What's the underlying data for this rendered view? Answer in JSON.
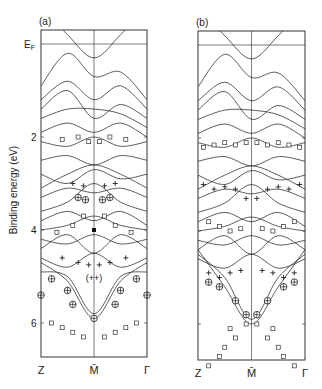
{
  "chart_data": {
    "type": "line",
    "title": "",
    "ylabel": "Binding energy (eV)",
    "xlabel": "",
    "ylim": [
      6.9,
      -0.3
    ],
    "y_ticks": [
      {
        "label": "E_F",
        "value": 0
      },
      {
        "label": "2",
        "value": 2
      },
      {
        "label": "4",
        "value": 4
      },
      {
        "label": "6",
        "value": 6
      }
    ],
    "panels": [
      {
        "id": "a",
        "label": "(a)",
        "x_ticks": [
          "Z",
          "M̄",
          "Γ"
        ],
        "annotation": {
          "text": "(++)",
          "x": 0.5,
          "y": 5.0
        },
        "bands": [
          [
            -0.8,
            -0.2,
            0.3,
            -0.2,
            -0.8
          ],
          [
            0.9,
            0.2,
            0.7,
            0.6,
            1.2
          ],
          [
            1.2,
            0.8,
            1.2,
            0.9,
            1.4
          ],
          [
            1.4,
            1.0,
            1.6,
            1.3,
            1.6
          ],
          [
            1.6,
            1.4,
            1.4,
            1.5,
            1.8
          ],
          [
            1.9,
            1.7,
            1.9,
            1.7,
            2.0
          ],
          [
            2.1,
            2.2,
            2.0,
            2.2,
            2.1
          ],
          [
            2.5,
            2.4,
            2.6,
            2.4,
            2.5
          ],
          [
            2.8,
            3.0,
            2.7,
            2.9,
            2.8
          ],
          [
            3.1,
            2.8,
            2.6,
            2.8,
            3.1
          ],
          [
            3.3,
            3.1,
            3.2,
            3.1,
            3.3
          ],
          [
            3.6,
            3.4,
            3.0,
            3.4,
            3.6
          ],
          [
            3.8,
            3.6,
            3.8,
            3.6,
            3.9
          ],
          [
            4.0,
            3.9,
            3.7,
            3.9,
            4.0
          ],
          [
            4.2,
            4.3,
            4.1,
            4.3,
            4.2
          ],
          [
            4.4,
            4.1,
            4.5,
            4.1,
            4.4
          ],
          [
            4.6,
            4.8,
            4.5,
            4.8,
            4.6
          ],
          [
            4.9,
            5.0,
            5.8,
            5.0,
            4.9
          ],
          [
            4.7,
            5.1,
            5.9,
            5.1,
            4.7
          ]
        ],
        "markers": {
          "squares": [
            [
              0.2,
              2.05
            ],
            [
              0.35,
              2.0
            ],
            [
              0.45,
              2.1
            ],
            [
              0.55,
              2.1
            ],
            [
              0.65,
              2.0
            ],
            [
              0.8,
              2.05
            ],
            [
              0.3,
              3.9
            ],
            [
              0.4,
              3.7
            ],
            [
              0.6,
              3.7
            ],
            [
              0.7,
              3.9
            ],
            [
              0.15,
              4.05
            ],
            [
              0.85,
              4.05
            ],
            [
              0.1,
              6.0
            ],
            [
              0.2,
              6.1
            ],
            [
              0.3,
              6.2
            ],
            [
              0.4,
              6.3
            ],
            [
              0.6,
              6.3
            ],
            [
              0.7,
              6.2
            ],
            [
              0.8,
              6.1
            ],
            [
              0.9,
              6.0
            ]
          ],
          "plus": [
            [
              0.3,
              3.0
            ],
            [
              0.4,
              3.05
            ],
            [
              0.6,
              3.05
            ],
            [
              0.7,
              3.0
            ],
            [
              0.2,
              4.6
            ],
            [
              0.35,
              4.7
            ],
            [
              0.45,
              4.75
            ],
            [
              0.55,
              4.75
            ],
            [
              0.65,
              4.7
            ],
            [
              0.8,
              4.6
            ]
          ],
          "circled_plus": [
            [
              0.35,
              3.3
            ],
            [
              0.42,
              3.35
            ],
            [
              0.58,
              3.35
            ],
            [
              0.65,
              3.3
            ],
            [
              0.1,
              5.05
            ],
            [
              0.9,
              5.05
            ],
            [
              0.25,
              5.3
            ],
            [
              0.75,
              5.3
            ],
            [
              0.0,
              5.4
            ],
            [
              1.0,
              5.4
            ],
            [
              0.3,
              5.6
            ],
            [
              0.7,
              5.6
            ],
            [
              0.5,
              5.9
            ]
          ],
          "filled": [
            [
              0.5,
              4.0
            ]
          ]
        }
      },
      {
        "id": "b",
        "label": "(b)",
        "x_ticks": [
          "Z",
          "M̄",
          "Γ"
        ],
        "bands": [
          [
            -0.8,
            -0.2,
            0.3,
            -0.2,
            -0.8
          ],
          [
            0.9,
            0.2,
            0.7,
            0.6,
            1.2
          ],
          [
            1.2,
            0.8,
            1.2,
            0.9,
            1.4
          ],
          [
            1.4,
            1.0,
            1.6,
            1.3,
            1.6
          ],
          [
            1.6,
            1.4,
            1.4,
            1.5,
            1.8
          ],
          [
            1.9,
            1.7,
            1.9,
            1.7,
            2.0
          ],
          [
            2.1,
            2.2,
            2.0,
            2.2,
            2.1
          ],
          [
            2.5,
            2.4,
            2.6,
            2.4,
            2.5
          ],
          [
            2.8,
            3.0,
            2.7,
            2.9,
            2.8
          ],
          [
            3.1,
            2.8,
            2.6,
            2.8,
            3.1
          ],
          [
            3.3,
            3.1,
            3.2,
            3.1,
            3.3
          ],
          [
            3.6,
            3.4,
            3.0,
            3.4,
            3.6
          ],
          [
            3.8,
            3.6,
            3.8,
            3.6,
            3.9
          ],
          [
            4.0,
            3.9,
            3.7,
            3.9,
            4.0
          ],
          [
            4.2,
            4.3,
            4.1,
            4.3,
            4.2
          ],
          [
            4.4,
            4.1,
            4.5,
            4.1,
            4.4
          ],
          [
            4.6,
            4.8,
            4.5,
            4.8,
            4.6
          ],
          [
            4.5,
            5.0,
            5.9,
            5.0,
            4.5
          ],
          [
            4.4,
            5.2,
            6.0,
            5.2,
            4.4
          ]
        ],
        "markers": {
          "squares": [
            [
              0.05,
              2.2
            ],
            [
              0.15,
              2.15
            ],
            [
              0.25,
              2.1
            ],
            [
              0.35,
              2.15
            ],
            [
              0.45,
              2.1
            ],
            [
              0.55,
              2.1
            ],
            [
              0.65,
              2.15
            ],
            [
              0.75,
              2.1
            ],
            [
              0.85,
              2.15
            ],
            [
              0.95,
              2.2
            ],
            [
              0.1,
              3.8
            ],
            [
              0.2,
              3.9
            ],
            [
              0.3,
              4.0
            ],
            [
              0.4,
              3.95
            ],
            [
              0.6,
              3.95
            ],
            [
              0.7,
              4.0
            ],
            [
              0.8,
              3.9
            ],
            [
              0.9,
              3.8
            ],
            [
              0.3,
              6.1
            ],
            [
              0.35,
              6.3
            ],
            [
              0.25,
              6.5
            ],
            [
              0.2,
              6.7
            ],
            [
              0.1,
              6.9
            ],
            [
              0.7,
              6.1
            ],
            [
              0.65,
              6.3
            ],
            [
              0.75,
              6.5
            ],
            [
              0.8,
              6.7
            ],
            [
              0.9,
              6.9
            ],
            [
              0.45,
              6.0
            ],
            [
              0.55,
              6.0
            ]
          ],
          "plus": [
            [
              0.05,
              3.0
            ],
            [
              0.15,
              3.1
            ],
            [
              0.25,
              3.05
            ],
            [
              0.35,
              3.1
            ],
            [
              0.45,
              3.3
            ],
            [
              0.55,
              3.3
            ],
            [
              0.65,
              3.1
            ],
            [
              0.75,
              3.05
            ],
            [
              0.85,
              3.1
            ],
            [
              0.95,
              3.0
            ],
            [
              0.1,
              4.9
            ],
            [
              0.2,
              5.0
            ],
            [
              0.3,
              4.9
            ],
            [
              0.4,
              4.85
            ],
            [
              0.6,
              4.85
            ],
            [
              0.7,
              4.9
            ],
            [
              0.8,
              5.0
            ],
            [
              0.9,
              4.9
            ]
          ],
          "circled_plus": [
            [
              0.1,
              5.1
            ],
            [
              0.9,
              5.1
            ],
            [
              0.2,
              5.2
            ],
            [
              0.8,
              5.2
            ],
            [
              0.35,
              5.5
            ],
            [
              0.65,
              5.5
            ],
            [
              0.45,
              5.8
            ],
            [
              0.55,
              5.8
            ]
          ]
        }
      }
    ]
  }
}
